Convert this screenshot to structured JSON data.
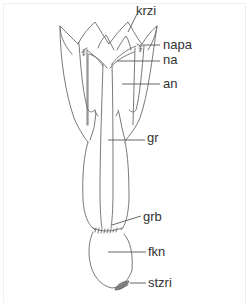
{
  "diagram": {
    "labels": [
      {
        "id": "krzi",
        "text": "krzi",
        "x": 136,
        "y": 5
      },
      {
        "id": "napa",
        "text": "napa",
        "x": 163,
        "y": 38
      },
      {
        "id": "na",
        "text": "na",
        "x": 163,
        "y": 55
      },
      {
        "id": "an",
        "text": "an",
        "x": 163,
        "y": 78
      },
      {
        "id": "gr",
        "text": "gr",
        "x": 147,
        "y": 131
      },
      {
        "id": "grb",
        "text": "grb",
        "x": 142,
        "y": 210
      },
      {
        "id": "fkn",
        "text": "fkn",
        "x": 148,
        "y": 245
      },
      {
        "id": "stzri",
        "text": "stzri",
        "x": 148,
        "y": 276
      }
    ],
    "colors": {
      "line": "#6a6a6a",
      "text": "#333333",
      "background": "#ffffff"
    }
  }
}
